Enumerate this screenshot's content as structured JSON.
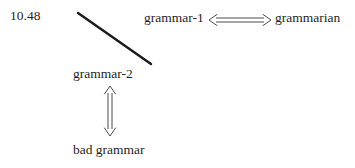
{
  "figure": {
    "number_label": "10.48",
    "background_color": "#ffffff",
    "ink_color": "#1f1f1f",
    "arrow_color": "#3a3a3a",
    "width": 355,
    "height": 168
  },
  "nodes": [
    {
      "id": "grammar-1",
      "label": "grammar-1"
    },
    {
      "id": "grammarian",
      "label": "grammarian"
    },
    {
      "id": "grammar-2",
      "label": "grammar-2"
    },
    {
      "id": "bad-grammar",
      "label": "bad grammar"
    }
  ],
  "connectors": [
    {
      "id": "grammar1-grammarian",
      "glyph_name": "long-left-right-double-arrow-icon",
      "glyph": "⟺",
      "orientation": "horizontal",
      "from": "grammar-1",
      "to": "grammarian",
      "bidirectional": true
    },
    {
      "id": "grammar2-badgrammar",
      "glyph_name": "up-down-double-arrow-icon",
      "glyph": "⇕",
      "orientation": "vertical",
      "from": "grammar-2",
      "to": "bad grammar",
      "bidirectional": true
    },
    {
      "id": "diagonal-stroke",
      "glyph_name": "diagonal-line-icon",
      "orientation": "diagonal",
      "from_point": [
        78,
        13
      ],
      "to_point": [
        151,
        64
      ],
      "bidirectional": false
    }
  ],
  "labels": {
    "grammar_1": "grammar-1",
    "grammarian": "grammarian",
    "grammar_2": "grammar-2",
    "bad_grammar": "bad grammar",
    "figure_number": "10.48"
  }
}
